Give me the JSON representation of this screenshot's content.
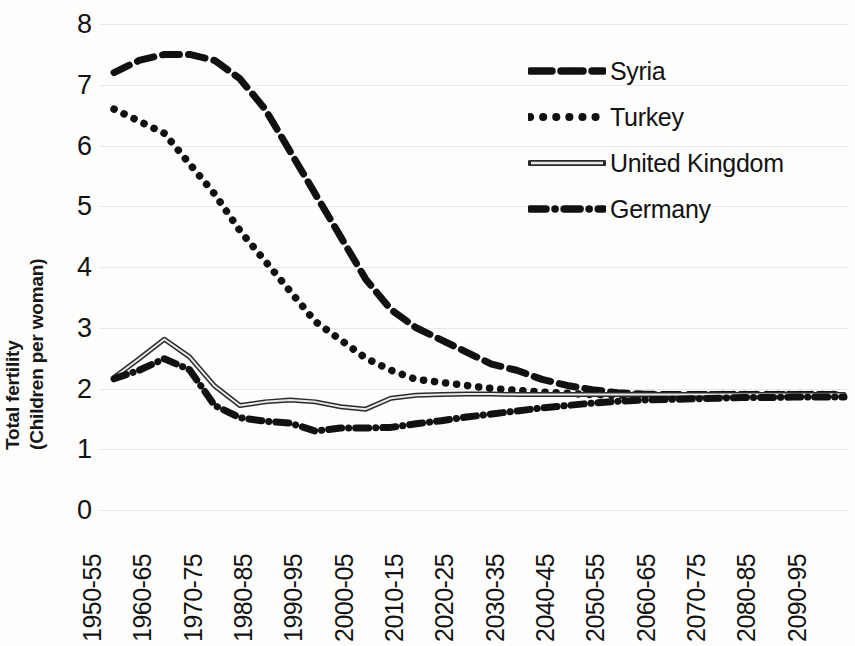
{
  "chart_data": {
    "type": "line",
    "title": "",
    "xlabel": "",
    "ylabel_line1": "Total fertility",
    "ylabel_line2": "(Children per woman)",
    "ylim": [
      0,
      8
    ],
    "yticks": [
      8,
      7,
      6,
      5,
      4,
      3,
      2,
      1,
      0
    ],
    "grid": true,
    "legend_position": "top-right",
    "categories": [
      "1950-55",
      "1955-60",
      "1960-65",
      "1965-70",
      "1970-75",
      "1975-80",
      "1980-85",
      "1985-90",
      "1990-95",
      "1995-00",
      "2000-05",
      "2005-10",
      "2010-15",
      "2015-20",
      "2020-25",
      "2025-30",
      "2030-35",
      "2035-40",
      "2040-45",
      "2045-50",
      "2050-55",
      "2055-60",
      "2060-65",
      "2065-70",
      "2070-75",
      "2075-80",
      "2080-85",
      "2085-90",
      "2090-95",
      "2095-00"
    ],
    "tick_labels_shown": [
      "1950-55",
      "1960-65",
      "1970-75",
      "1980-85",
      "1990-95",
      "2000-05",
      "2010-15",
      "2020-25",
      "2030-35",
      "2040-45",
      "2050-55",
      "2060-65",
      "2070-75",
      "2080-85",
      "2090-95"
    ],
    "series": [
      {
        "name": "Syria",
        "style": "long-dash",
        "color": "#111111",
        "values": [
          7.2,
          7.4,
          7.5,
          7.5,
          7.4,
          7.1,
          6.6,
          5.9,
          5.2,
          4.5,
          3.8,
          3.3,
          3.0,
          2.8,
          2.6,
          2.4,
          2.3,
          2.15,
          2.05,
          1.98,
          1.93,
          1.91,
          1.9,
          1.9,
          1.9,
          1.9,
          1.9,
          1.9,
          1.9,
          1.9
        ]
      },
      {
        "name": "Turkey",
        "style": "dotted",
        "color": "#111111",
        "values": [
          6.6,
          6.4,
          6.2,
          5.7,
          5.2,
          4.6,
          4.1,
          3.6,
          3.1,
          2.8,
          2.5,
          2.3,
          2.15,
          2.1,
          2.05,
          2.0,
          1.97,
          1.94,
          1.92,
          1.9,
          1.89,
          1.89,
          1.89,
          1.89,
          1.9,
          1.9,
          1.9,
          1.9,
          1.9,
          1.9
        ]
      },
      {
        "name": "United Kingdom",
        "style": "solid",
        "color": "#555555",
        "values": [
          2.18,
          2.49,
          2.81,
          2.52,
          2.04,
          1.72,
          1.78,
          1.81,
          1.78,
          1.7,
          1.66,
          1.84,
          1.89,
          1.9,
          1.91,
          1.91,
          1.9,
          1.9,
          1.9,
          1.9,
          1.9,
          1.9,
          1.9,
          1.9,
          1.9,
          1.9,
          1.9,
          1.9,
          1.9,
          1.9
        ]
      },
      {
        "name": "Germany",
        "style": "dash-dot",
        "color": "#111111",
        "values": [
          2.16,
          2.3,
          2.49,
          2.31,
          1.72,
          1.52,
          1.46,
          1.43,
          1.3,
          1.35,
          1.35,
          1.36,
          1.42,
          1.47,
          1.53,
          1.58,
          1.63,
          1.68,
          1.72,
          1.76,
          1.79,
          1.81,
          1.82,
          1.83,
          1.84,
          1.85,
          1.85,
          1.86,
          1.86,
          1.86
        ]
      }
    ]
  },
  "legend": {
    "items": [
      {
        "label": "Syria",
        "key": "long-dash-line-icon"
      },
      {
        "label": "Turkey",
        "key": "dotted-line-icon"
      },
      {
        "label": "United Kingdom",
        "key": "solid-line-icon"
      },
      {
        "label": "Germany",
        "key": "dash-dot-line-icon"
      }
    ]
  }
}
